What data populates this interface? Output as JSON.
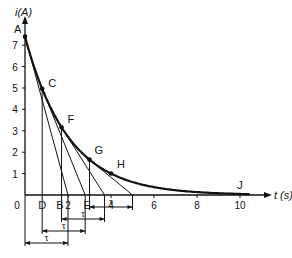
{
  "chart_data": {
    "type": "line",
    "title": "",
    "xlabel": "t (s)",
    "ylabel": "i (A)",
    "xlim": [
      0,
      11
    ],
    "ylim": [
      0,
      8
    ],
    "x_ticks": [
      "0",
      "2",
      "4",
      "6",
      "8",
      "10"
    ],
    "y_ticks": [
      "1",
      "2",
      "3",
      "4",
      "5",
      "6",
      "7"
    ],
    "grid": false,
    "legend": null,
    "series": [
      {
        "name": "i(t) exponential decay",
        "model": "i = 7.4 * exp(-t / 2)",
        "x": [
          0,
          0.8,
          1.7,
          3.0,
          4.0,
          6.0,
          8.0,
          10.0
        ],
        "y": [
          7.4,
          5.0,
          3.2,
          1.65,
          1.0,
          0.37,
          0.14,
          0.05
        ]
      }
    ],
    "points": [
      {
        "label": "A",
        "t": 0,
        "i": 7.4
      },
      {
        "label": "C",
        "t": 0.8,
        "i": 6.0
      },
      {
        "label": "F",
        "t": 1.7,
        "i": 4.0
      },
      {
        "label": "G",
        "t": 3.0,
        "i": 2.0
      },
      {
        "label": "H",
        "t": 4.0,
        "i": 1.0
      },
      {
        "label": "J",
        "t": 10.0,
        "i": 0.0
      }
    ],
    "axis_points": [
      {
        "label": "0",
        "t": 0
      },
      {
        "label": "D",
        "t": 0.8
      },
      {
        "label": "B",
        "t": 2.0
      },
      {
        "label": "E",
        "t": 2.8
      }
    ],
    "tangents": [
      {
        "from": "A",
        "to_t": 2.0
      },
      {
        "from": "C",
        "to_t": 2.8
      },
      {
        "from": "F",
        "to_t": 3.7
      },
      {
        "from": "G",
        "to_t": 5.0
      }
    ],
    "annotations": [
      {
        "text": "τ",
        "span_t": [
          0,
          2.0
        ]
      },
      {
        "text": "τ",
        "span_t": [
          0.8,
          2.8
        ]
      },
      {
        "text": "τ",
        "span_t": [
          1.7,
          3.7
        ]
      },
      {
        "text": "τ",
        "span_t": [
          3.0,
          5.0
        ]
      }
    ]
  },
  "labels": {
    "y_axis": "i(A)",
    "x_axis": "t (s)",
    "origin": "0",
    "tau": "τ",
    "A": "A",
    "C": "C",
    "F": "F",
    "G": "G",
    "H": "H",
    "J": "J",
    "D": "D",
    "B": "B",
    "E": "E"
  },
  "colors": {
    "ink": "#111111",
    "background": "#ffffff"
  }
}
